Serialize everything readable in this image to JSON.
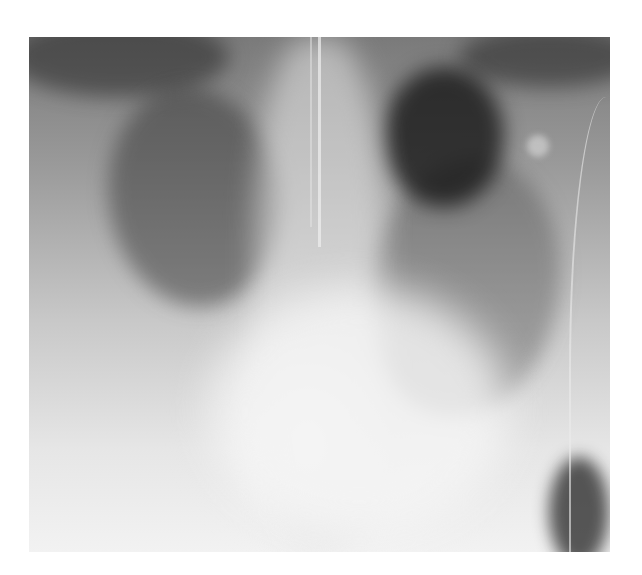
{
  "image": {
    "type": "chest-xray",
    "view": "frontal",
    "alt": "Frontal chest radiograph showing bilateral diffuse opacities with an endotracheal tube and support lines",
    "frame": {
      "x": 29,
      "y": 37,
      "width": 581,
      "height": 515
    }
  }
}
